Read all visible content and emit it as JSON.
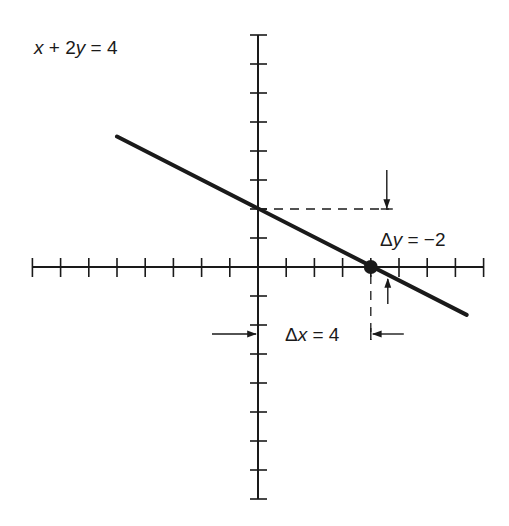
{
  "colors": {
    "ink": "#1a1a1a",
    "background": "#ffffff"
  },
  "equation": {
    "text": "x + 2y = 4",
    "parts": [
      {
        "t": "x",
        "italic": true
      },
      {
        "t": " + 2",
        "italic": false
      },
      {
        "t": "y",
        "italic": true
      },
      {
        "t": " = 4",
        "italic": false
      }
    ]
  },
  "axes": {
    "origin_px": [
      258,
      267
    ],
    "x_unit_px": 28.2,
    "y_unit_px": 29,
    "x_range": [
      -8,
      8
    ],
    "y_range": [
      -8,
      8
    ],
    "tick_labels_shown": false
  },
  "line": {
    "equation": "x + 2y = 4",
    "slope": -0.5,
    "y_intercept": 2,
    "x_intercept": 4,
    "from": [
      -5,
      4.5
    ],
    "to": [
      7.4,
      -1.65
    ]
  },
  "points": [
    {
      "name": "x-intercept",
      "x": 4,
      "y": 0,
      "marker": "filled-dot"
    }
  ],
  "annotations": {
    "delta_y": {
      "text": "Δy = −2",
      "symbol": "Δ",
      "var": "y",
      "rest": " = −2",
      "from_y": 2,
      "to_y": 0
    },
    "delta_x": {
      "text": "Δx = 4",
      "symbol": "Δ",
      "var": "x",
      "rest": " = 4",
      "from_x": 0,
      "to_x": 4
    }
  }
}
